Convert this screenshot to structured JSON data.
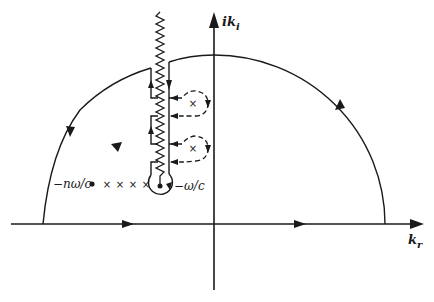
{
  "diagram": {
    "type": "contour-integration",
    "colors": {
      "stroke": "#1a1a1a",
      "background": "#ffffff"
    },
    "axes": {
      "real_label": "k",
      "real_sub": "r",
      "imag_label": "ik",
      "imag_sub": "i"
    },
    "labels": {
      "branch_point": "−ω/c",
      "pole_row_start": "−nω/c"
    },
    "poles": {
      "row_markers": [
        "dot",
        "x",
        "x",
        "x",
        "x"
      ],
      "loop_poles": [
        "x",
        "x"
      ]
    }
  }
}
